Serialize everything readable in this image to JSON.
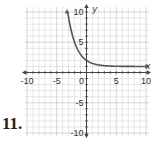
{
  "problem": {
    "number": "11."
  },
  "chart_data": {
    "type": "line",
    "title": "",
    "xlabel": "x",
    "ylabel": "y",
    "xlim": [
      -10,
      10
    ],
    "ylim": [
      -10,
      10
    ],
    "grid": true,
    "grid_step": 1,
    "x_tick_labels": [
      "-10",
      "-5",
      "0",
      "5",
      "10"
    ],
    "y_tick_labels": [
      "10",
      "5",
      "-5",
      "-10"
    ],
    "x_ticks": [
      -10,
      -5,
      0,
      5,
      10
    ],
    "y_ticks": [
      10,
      5,
      -5,
      -10
    ],
    "series": [
      {
        "name": "y = (1/2)^x + 1",
        "x": [
          -3.17,
          -3,
          -2.5,
          -2,
          -1.5,
          -1,
          -0.5,
          0,
          0.5,
          1,
          1.5,
          2,
          3,
          4,
          5,
          6,
          7,
          8,
          9,
          10
        ],
        "y": [
          10,
          9,
          6.66,
          5,
          3.83,
          3,
          2.41,
          2,
          1.71,
          1.5,
          1.35,
          1.25,
          1.125,
          1.06,
          1.03,
          1.02,
          1.01,
          1.0,
          1.0,
          1.0
        ],
        "color": "#555555",
        "arrow_ends": true
      }
    ],
    "asymptote": {
      "y": 1,
      "drawn": false
    },
    "legend": null
  }
}
